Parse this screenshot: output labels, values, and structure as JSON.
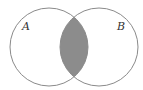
{
  "diagram": {
    "type": "venn",
    "sets": [
      {
        "label": "A",
        "cx": 49,
        "cy": 47,
        "r": 39
      },
      {
        "label": "B",
        "cx": 99,
        "cy": 47,
        "r": 39
      }
    ],
    "shaded_region": "A ∩ B",
    "colors": {
      "stroke": "#8a8a8a",
      "fill_shaded": "#8c8c8c",
      "background": "#ffffff"
    }
  }
}
